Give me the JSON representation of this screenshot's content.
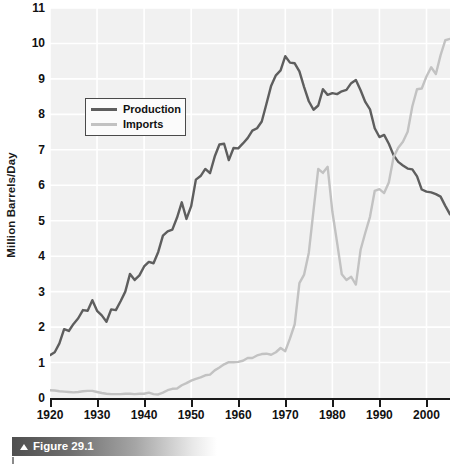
{
  "figure": {
    "caption": "Figure 29.1",
    "caption_icon": "triangle-up-icon"
  },
  "colors": {
    "production": "#5e5e5e",
    "imports": "#c2c2c2",
    "plot_background": "#f1f1f1",
    "gridline": "#ffffff",
    "axis": "#1a1a1a",
    "text": "#111111"
  },
  "legend": {
    "position": "inside-top-left",
    "entries": [
      {
        "label": "Production",
        "color": "#5e5e5e"
      },
      {
        "label": "Imports",
        "color": "#c2c2c2"
      }
    ]
  },
  "chart_data": {
    "type": "line",
    "title": "",
    "subtitle": "",
    "xlabel": "",
    "ylabel": "Million Barrels/Day",
    "xlim": [
      1920,
      2005
    ],
    "ylim": [
      0,
      11
    ],
    "grid": true,
    "legend_position": "inside-top-left",
    "xticks": [
      1920,
      1930,
      1940,
      1950,
      1960,
      1970,
      1980,
      1990,
      2000
    ],
    "xtick_labels": [
      "1920",
      "1930",
      "1940",
      "1950",
      "1960",
      "1970",
      "1980",
      "1990",
      "2000"
    ],
    "yticks": [
      0,
      1,
      2,
      3,
      4,
      5,
      6,
      7,
      8,
      9,
      10,
      11
    ],
    "ytick_labels": [
      "0",
      "1",
      "2",
      "3",
      "4",
      "5",
      "6",
      "7",
      "8",
      "9",
      "10",
      "11"
    ],
    "x": [
      1920,
      1921,
      1922,
      1923,
      1924,
      1925,
      1926,
      1927,
      1928,
      1929,
      1930,
      1931,
      1932,
      1933,
      1934,
      1935,
      1936,
      1937,
      1938,
      1939,
      1940,
      1941,
      1942,
      1943,
      1944,
      1945,
      1946,
      1947,
      1948,
      1949,
      1950,
      1951,
      1952,
      1953,
      1954,
      1955,
      1956,
      1957,
      1958,
      1959,
      1960,
      1961,
      1962,
      1963,
      1964,
      1965,
      1966,
      1967,
      1968,
      1969,
      1970,
      1971,
      1972,
      1973,
      1974,
      1975,
      1976,
      1977,
      1978,
      1979,
      1980,
      1981,
      1982,
      1983,
      1984,
      1985,
      1986,
      1987,
      1988,
      1989,
      1990,
      1991,
      1992,
      1993,
      1994,
      1995,
      1996,
      1997,
      1998,
      1999,
      2000,
      2001,
      2002,
      2003,
      2004,
      2005
    ],
    "series": [
      {
        "name": "Production",
        "color": "#5e5e5e",
        "values": [
          1.21,
          1.29,
          1.54,
          1.94,
          1.89,
          2.09,
          2.25,
          2.48,
          2.46,
          2.76,
          2.46,
          2.33,
          2.15,
          2.5,
          2.48,
          2.73,
          3.0,
          3.5,
          3.33,
          3.46,
          3.71,
          3.84,
          3.8,
          4.12,
          4.58,
          4.7,
          4.75,
          5.09,
          5.52,
          5.05,
          5.41,
          6.16,
          6.26,
          6.46,
          6.34,
          6.81,
          7.15,
          7.17,
          6.71,
          7.05,
          7.04,
          7.18,
          7.33,
          7.54,
          7.61,
          7.8,
          8.3,
          8.81,
          9.1,
          9.24,
          9.64,
          9.46,
          9.44,
          9.21,
          8.77,
          8.37,
          8.13,
          8.25,
          8.71,
          8.55,
          8.6,
          8.57,
          8.65,
          8.69,
          8.88,
          8.97,
          8.68,
          8.35,
          8.14,
          7.61,
          7.36,
          7.42,
          7.17,
          6.85,
          6.66,
          6.56,
          6.47,
          6.45,
          6.25,
          5.88,
          5.82,
          5.8,
          5.75,
          5.68,
          5.42,
          5.18
        ]
      },
      {
        "name": "Imports",
        "color": "#c2c2c2",
        "values": [
          0.22,
          0.21,
          0.19,
          0.18,
          0.17,
          0.16,
          0.17,
          0.19,
          0.2,
          0.2,
          0.17,
          0.14,
          0.12,
          0.11,
          0.11,
          0.11,
          0.12,
          0.12,
          0.11,
          0.12,
          0.12,
          0.15,
          0.11,
          0.1,
          0.15,
          0.22,
          0.26,
          0.27,
          0.36,
          0.42,
          0.49,
          0.54,
          0.58,
          0.64,
          0.66,
          0.78,
          0.86,
          0.95,
          1.01,
          1.01,
          1.02,
          1.05,
          1.13,
          1.13,
          1.2,
          1.24,
          1.25,
          1.22,
          1.29,
          1.41,
          1.32,
          1.68,
          2.08,
          3.24,
          3.48,
          4.1,
          5.29,
          6.46,
          6.35,
          6.52,
          5.26,
          4.39,
          3.49,
          3.33,
          3.42,
          3.2,
          4.18,
          4.66,
          5.11,
          5.84,
          5.89,
          5.78,
          6.08,
          6.79,
          7.06,
          7.23,
          7.51,
          8.23,
          8.71,
          8.73,
          9.07,
          9.33,
          9.14,
          9.67,
          10.09,
          10.13
        ]
      }
    ]
  }
}
